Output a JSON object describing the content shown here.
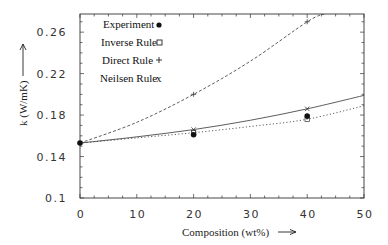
{
  "chart_data": {
    "type": "line",
    "title": "",
    "xlabel": "Composition (wt%)",
    "ylabel": "k (W/mK)",
    "xlabel_arrow": "→",
    "ylabel_arrow": "↑",
    "xlim": [
      0,
      50
    ],
    "ylim": [
      0.1,
      0.2775
    ],
    "xticks": [
      0,
      10,
      20,
      30,
      40,
      50
    ],
    "xtick_labels": [
      "0",
      "10",
      "20",
      "30",
      "40",
      "50"
    ],
    "yticks": [
      0.1,
      0.14,
      0.18,
      0.22,
      0.26
    ],
    "ytick_labels": [
      "0.1",
      "0.14",
      "0.18",
      "0.22",
      "0.26"
    ],
    "grid": false,
    "legend_position": "upper-left-inside",
    "series": [
      {
        "name": "Experiment",
        "marker": "filled-circle",
        "line": "none",
        "x": [
          0,
          20,
          40
        ],
        "values": [
          0.153,
          0.161,
          0.179
        ]
      },
      {
        "name": "Inverse Rule",
        "marker": "open-square",
        "line": "dotted",
        "x": [
          0,
          10,
          20,
          30,
          40,
          50
        ],
        "values": [
          0.153,
          0.158,
          0.163,
          0.169,
          0.176,
          0.189
        ]
      },
      {
        "name": "Direct Rule",
        "marker": "plus",
        "line": "dashed",
        "x": [
          0,
          10,
          20,
          30,
          40,
          43
        ],
        "values": [
          0.153,
          0.173,
          0.2,
          0.232,
          0.27,
          0.2775
        ]
      },
      {
        "name": "Neilsen Rule",
        "marker": "x",
        "line": "solid",
        "x": [
          0,
          10,
          20,
          30,
          40,
          50
        ],
        "values": [
          0.153,
          0.159,
          0.166,
          0.175,
          0.186,
          0.199
        ]
      }
    ]
  },
  "legend": {
    "items": [
      {
        "label": "Experiment",
        "symbol": "●"
      },
      {
        "label": "Inverse Rule",
        "symbol": "□"
      },
      {
        "label": "Direct Rule",
        "symbol": "+"
      },
      {
        "label": "Neilsen Rule",
        "symbol": "x"
      }
    ]
  },
  "axes": {
    "x_title": "Composition (wt%)",
    "y_title": "k (W/mK)"
  }
}
